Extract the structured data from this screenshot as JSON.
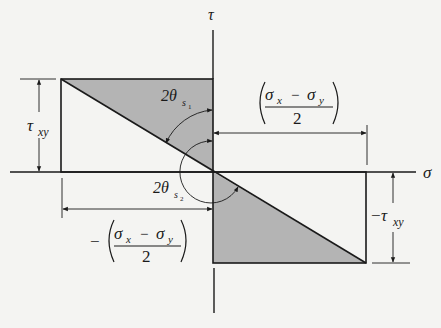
{
  "diagram": {
    "axes": {
      "horizontal_label": "σ",
      "vertical_label": "τ"
    },
    "labels": {
      "tau_xy_left": {
        "main": "τ",
        "sub": "xy"
      },
      "tau_xy_right": {
        "sign": "−",
        "main": "τ",
        "sub": "xy"
      },
      "angle_s1": {
        "prefix": "2θ",
        "sub": "s",
        "subsub": "1"
      },
      "angle_s2": {
        "prefix": "2θ",
        "sub": "s",
        "subsub": "2"
      },
      "half_diff_pos": {
        "num_a": "σ",
        "num_a_sub": "x",
        "minus": "−",
        "num_b": "σ",
        "num_b_sub": "y",
        "den": "2"
      },
      "half_diff_neg": {
        "sign": "−",
        "num_a": "σ",
        "num_a_sub": "x",
        "minus": "−",
        "num_b": "σ",
        "num_b_sub": "y",
        "den": "2"
      }
    },
    "colors": {
      "background": "#f4f4f2",
      "shade": "#b4b4b4",
      "line": "#1a1a1a"
    }
  }
}
